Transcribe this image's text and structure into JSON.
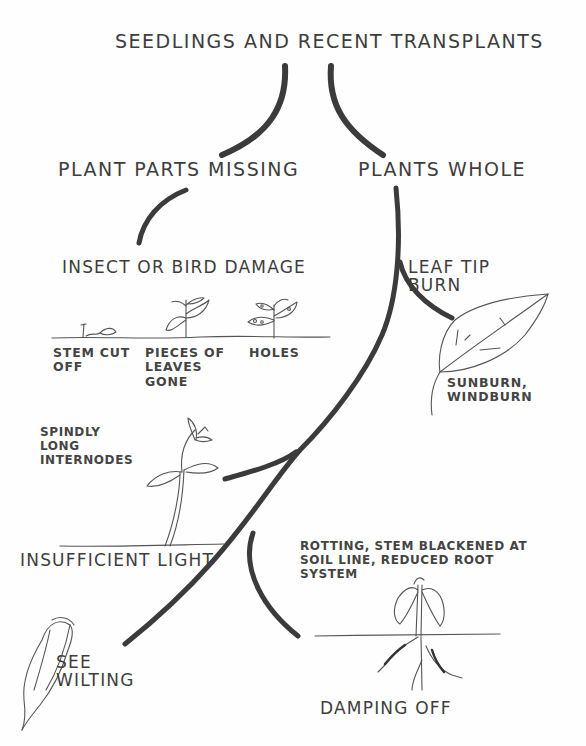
{
  "diagram": {
    "title": "Seedlings and recent transplants",
    "colors": {
      "branch_line": "#3b3b3b",
      "sketch_line": "#555555",
      "text": "#3d3d3d",
      "background": "#fefefe"
    },
    "branches": {
      "left": {
        "label": "Plant parts missing",
        "child": {
          "label": "Insect or bird damage",
          "symptoms": [
            {
              "label": "Stem cut\noff",
              "icon": "cut-stem-sketch"
            },
            {
              "label": "Pieces of\nleaves\ngone",
              "icon": "chewed-leaves-plant-sketch"
            },
            {
              "label": "Holes",
              "icon": "holed-leaves-plant-sketch"
            }
          ]
        }
      },
      "right": {
        "label": "Plants whole",
        "children": [
          {
            "label": "Leaf tip\nburn",
            "note": "Sunburn,\nwindburn",
            "icon": "burnt-leaf-sketch"
          },
          {
            "label": "Insufficient light",
            "note": "Spindly\nlong\ninternodes",
            "icon": "spindly-seedling-sketch"
          },
          {
            "label": "See\nwilting",
            "icon": "wilted-leaf-sketch"
          },
          {
            "label": "Damping off",
            "note": "Rotting, stem blackened at\nsoil line, reduced root\nsystem",
            "icon": "rotting-seedling-sketch"
          }
        ]
      }
    }
  }
}
